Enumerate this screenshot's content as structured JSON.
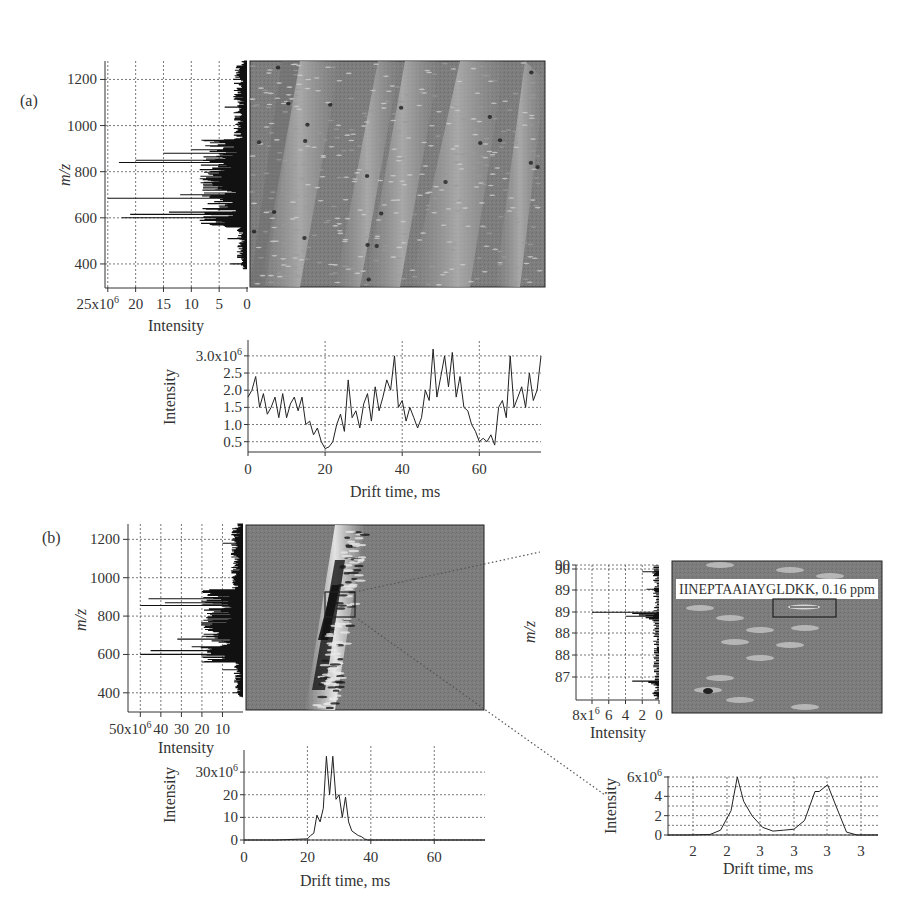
{
  "figure": {
    "panel_a_label": "(a)",
    "panel_b_label": "(b)",
    "annotation": "IINEPTAAIAYGLDKK, 0.16 ppm"
  },
  "colors": {
    "background": "#ffffff",
    "heatmap_base": "#7a7a7a",
    "trace": "#222222",
    "grid": "#555555"
  },
  "chart_data": [
    {
      "id": "a_mz_spectrum",
      "type": "bar",
      "orientation": "horizontal",
      "title": "",
      "xlabel": "Intensity",
      "ylabel": "m/z",
      "x_ticks": [
        "25x10^6",
        "20",
        "15",
        "10",
        "5",
        "0"
      ],
      "x_tick_values": [
        25000000,
        20000000,
        15000000,
        10000000,
        5000000,
        0
      ],
      "y_ticks": [
        "400",
        "600",
        "800",
        "1000",
        "1200"
      ],
      "xlim": [
        25500000,
        0
      ],
      "ylim": [
        300,
        1280
      ],
      "grid": true,
      "x_reversed": true,
      "peaks": [
        {
          "mz": 400,
          "intensity": 3000000
        },
        {
          "mz": 510,
          "intensity": 3500000
        },
        {
          "mz": 600,
          "intensity": 22500000
        },
        {
          "mz": 615,
          "intensity": 21000000
        },
        {
          "mz": 625,
          "intensity": 14000000
        },
        {
          "mz": 640,
          "intensity": 8000000
        },
        {
          "mz": 685,
          "intensity": 25000000
        },
        {
          "mz": 700,
          "intensity": 12000000
        },
        {
          "mz": 720,
          "intensity": 8000000
        },
        {
          "mz": 760,
          "intensity": 6000000
        },
        {
          "mz": 840,
          "intensity": 23000000
        },
        {
          "mz": 850,
          "intensity": 20000000
        },
        {
          "mz": 880,
          "intensity": 15000000
        },
        {
          "mz": 895,
          "intensity": 10000000
        },
        {
          "mz": 1080,
          "intensity": 4000000
        },
        {
          "mz": 1200,
          "intensity": 2500000
        }
      ]
    },
    {
      "id": "a_heatmap",
      "type": "heatmap",
      "title": "",
      "xlabel": "Drift time, ms",
      "ylabel": "m/z",
      "xlim": [
        0,
        76
      ],
      "ylim": [
        300,
        1280
      ],
      "description": "Drift time vs m/z map showing four diagonal bands of ions (charge-state trend lines), with dense spots near m/z 600 and 850"
    },
    {
      "id": "a_drift_profile",
      "type": "line",
      "title": "",
      "xlabel": "Drift time, ms",
      "ylabel": "Intensity",
      "x_ticks": [
        "0",
        "20",
        "40",
        "60"
      ],
      "y_ticks": [
        "0.5",
        "1.0",
        "1.5",
        "2.0",
        "2.5",
        "3.0x10^6"
      ],
      "xlim": [
        0,
        76
      ],
      "ylim": [
        200000,
        3200000
      ],
      "grid": true,
      "x": [
        0,
        1,
        2,
        3,
        4,
        5,
        6,
        7,
        8,
        9,
        10,
        11,
        12,
        13,
        14,
        15,
        16,
        17,
        18,
        19,
        20,
        21,
        22,
        23,
        24,
        25,
        26,
        27,
        28,
        29,
        30,
        31,
        32,
        33,
        34,
        35,
        36,
        37,
        38,
        39,
        40,
        41,
        42,
        43,
        44,
        45,
        46,
        47,
        48,
        49,
        50,
        51,
        52,
        53,
        54,
        55,
        56,
        57,
        58,
        59,
        60,
        61,
        62,
        63,
        64,
        65,
        66,
        67,
        68,
        69,
        70,
        71,
        72,
        73,
        74,
        75,
        76
      ],
      "values": [
        1.8,
        2.0,
        2.4,
        1.5,
        1.9,
        1.3,
        1.5,
        1.8,
        1.2,
        1.9,
        1.2,
        1.6,
        1.8,
        1.4,
        1.8,
        1.0,
        1.1,
        0.7,
        0.9,
        0.5,
        0.3,
        0.35,
        0.5,
        1.0,
        1.3,
        0.8,
        2.3,
        1.2,
        1.4,
        0.9,
        1.6,
        1.9,
        1.1,
        2.1,
        1.4,
        1.8,
        2.3,
        2.0,
        3.0,
        1.5,
        1.7,
        1.1,
        1.5,
        1.2,
        0.9,
        1.2,
        2.0,
        1.7,
        3.2,
        1.8,
        2.4,
        3.0,
        2.1,
        3.1,
        1.8,
        2.4,
        1.5,
        1.4,
        1.0,
        0.8,
        0.5,
        0.6,
        0.5,
        0.7,
        0.4,
        1.5,
        1.7,
        1.2,
        3.0,
        1.5,
        1.8,
        2.1,
        1.5,
        2.5,
        1.7,
        2.0,
        3.0
      ],
      "units": "x10^6"
    },
    {
      "id": "b_mz_spectrum",
      "type": "bar",
      "orientation": "horizontal",
      "title": "",
      "xlabel": "Intensity",
      "ylabel": "m/z",
      "x_ticks": [
        "50x10^6",
        "40",
        "30",
        "20",
        "10"
      ],
      "x_tick_values": [
        50000000,
        40000000,
        30000000,
        20000000,
        10000000
      ],
      "y_ticks": [
        "400",
        "600",
        "800",
        "1000",
        "1200"
      ],
      "xlim": [
        56000000,
        0
      ],
      "ylim": [
        300,
        1280
      ],
      "grid": true,
      "x_reversed": true,
      "peaks": [
        {
          "mz": 400,
          "intensity": 5000000
        },
        {
          "mz": 520,
          "intensity": 10000000
        },
        {
          "mz": 600,
          "intensity": 50000000
        },
        {
          "mz": 620,
          "intensity": 45000000
        },
        {
          "mz": 640,
          "intensity": 25000000
        },
        {
          "mz": 680,
          "intensity": 32000000
        },
        {
          "mz": 760,
          "intensity": 15000000
        },
        {
          "mz": 855,
          "intensity": 50000000
        },
        {
          "mz": 870,
          "intensity": 38000000
        },
        {
          "mz": 890,
          "intensity": 46000000
        },
        {
          "mz": 910,
          "intensity": 15000000
        },
        {
          "mz": 1180,
          "intensity": 10000000
        }
      ]
    },
    {
      "id": "b_heatmap",
      "type": "heatmap",
      "title": "",
      "xlabel": "Drift time, ms",
      "ylabel": "m/z",
      "xlim": [
        0,
        76
      ],
      "ylim": [
        300,
        1280
      ],
      "description": "Single diagonal band from ~22 ms at m/z 350 to ~32 ms at m/z 1250, with a boxed region near m/z 880 zoomed in at right"
    },
    {
      "id": "b_drift_profile",
      "type": "line",
      "title": "",
      "xlabel": "Drift time, ms",
      "ylabel": "Intensity",
      "x_ticks": [
        "0",
        "20",
        "40",
        "60"
      ],
      "y_ticks": [
        "0",
        "10",
        "20",
        "30x10^6"
      ],
      "xlim": [
        0,
        76
      ],
      "ylim": [
        0,
        38000000
      ],
      "grid": true,
      "x": [
        0,
        10,
        20,
        21,
        22,
        23,
        24,
        25,
        26,
        27,
        28,
        29,
        30,
        31,
        32,
        33,
        34,
        35,
        36,
        37,
        38,
        39,
        40,
        50,
        60,
        76
      ],
      "values": [
        0,
        0,
        0.5,
        2,
        3,
        11,
        8,
        14,
        37,
        20,
        37,
        18,
        20,
        10,
        19,
        8,
        4,
        3,
        2,
        1.5,
        0.5,
        0,
        0,
        0,
        0,
        0
      ],
      "units": "x10^6"
    },
    {
      "id": "b_zoom_mz_spectrum",
      "type": "bar",
      "orientation": "horizontal",
      "title": "",
      "xlabel": "Intensity",
      "ylabel": "m/z",
      "x_ticks": [
        "8x1^6",
        "6",
        "4",
        "2",
        "0"
      ],
      "x_tick_values": [
        8000000,
        6000000,
        4000000,
        2000000,
        0
      ],
      "y_ticks": [
        "87",
        "88",
        "88",
        "89",
        "89",
        "90",
        "90"
      ],
      "grid": true,
      "x_reversed": true,
      "peaks": [
        {
          "row": 0.05,
          "intensity": 2000000
        },
        {
          "row": 0.18,
          "intensity": 1500000
        },
        {
          "row": 0.35,
          "intensity": 8000000
        },
        {
          "row": 0.38,
          "intensity": 4000000
        },
        {
          "row": 0.62,
          "intensity": 600000
        },
        {
          "row": 0.86,
          "intensity": 3200000
        },
        {
          "row": 0.95,
          "intensity": 800000
        }
      ]
    },
    {
      "id": "b_zoom_heatmap",
      "type": "heatmap",
      "title": "",
      "annotation": "IINEPTAAIAYGLDKK, 0.16 ppm",
      "description": "Zoomed drift time vs m/z region with a boxed feature labeled with peptide IINEPTAAIAYGLDKK, mass error 0.16 ppm"
    },
    {
      "id": "b_zoom_drift_profile",
      "type": "line",
      "title": "",
      "xlabel": "Drift time, ms",
      "ylabel": "Intensity",
      "x_ticks": [
        "2",
        "2",
        "3",
        "3",
        "3",
        "3"
      ],
      "y_ticks": [
        "0",
        "2",
        "4",
        "6x10^6"
      ],
      "ylim": [
        0,
        6000000
      ],
      "grid": true,
      "x": [
        0,
        0.1,
        0.2,
        0.25,
        0.3,
        0.33,
        0.36,
        0.4,
        0.45,
        0.5,
        0.55,
        0.6,
        0.65,
        0.7,
        0.72,
        0.76,
        0.8,
        0.85,
        0.9,
        0.95,
        1.0
      ],
      "values": [
        0,
        0,
        0.05,
        0.5,
        2.5,
        6.0,
        3.5,
        2.0,
        0.8,
        0.4,
        0.5,
        0.6,
        1.5,
        4.5,
        4.5,
        5.2,
        3.0,
        0.3,
        0,
        0,
        0
      ],
      "units": "x10^6"
    }
  ]
}
